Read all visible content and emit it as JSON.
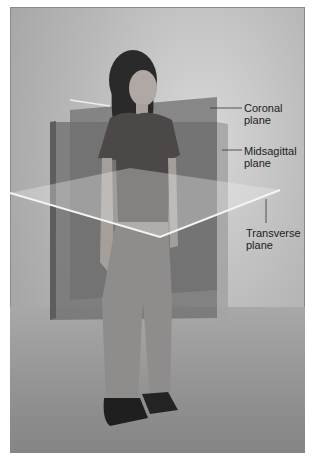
{
  "figure": {
    "labels": {
      "coronal": [
        "Coronal",
        "plane"
      ],
      "midsagittal": [
        "Midsagittal",
        "plane"
      ],
      "transverse": [
        "Transverse",
        "plane"
      ]
    }
  },
  "colors": {
    "coronal_plane": "#6f6f6f",
    "midsagittal_plane": "#9a9a9a",
    "transverse_plane": "#e6e6e6",
    "leader_line": "#333333",
    "label_text": "#222222"
  }
}
